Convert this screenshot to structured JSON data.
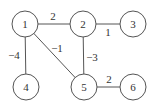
{
  "graph": {
    "nodes": [
      {
        "id": "1",
        "label": "1",
        "x": 25,
        "y": 24
      },
      {
        "id": "2",
        "label": "2",
        "x": 83,
        "y": 24
      },
      {
        "id": "3",
        "label": "3",
        "x": 133,
        "y": 24
      },
      {
        "id": "4",
        "label": "4",
        "x": 26,
        "y": 87
      },
      {
        "id": "5",
        "label": "5",
        "x": 84,
        "y": 87
      },
      {
        "id": "6",
        "label": "6",
        "x": 133,
        "y": 87
      }
    ],
    "radius": 13,
    "edges": [
      {
        "from": "1",
        "to": "2",
        "weight": "2",
        "lx": 53,
        "ly": 20
      },
      {
        "from": "2",
        "to": "3",
        "weight": "1",
        "lx": 108,
        "ly": 36
      },
      {
        "from": "1",
        "to": "4",
        "weight": "−4",
        "lx": 14,
        "ly": 59
      },
      {
        "from": "1",
        "to": "5",
        "weight": "−1",
        "lx": 57,
        "ly": 52
      },
      {
        "from": "2",
        "to": "5",
        "weight": "−3",
        "lx": 92,
        "ly": 61
      },
      {
        "from": "5",
        "to": "6",
        "weight": "2",
        "lx": 109,
        "ly": 83
      }
    ]
  }
}
